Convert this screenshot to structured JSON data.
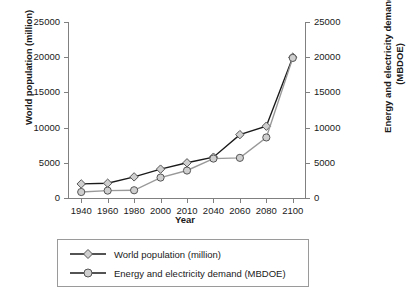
{
  "chart_data": {
    "type": "line",
    "title": "",
    "xlabel": "Year",
    "ylabel": "World population (million)",
    "y2label": "Energy and electricity demand (MBDOE)",
    "categories": [
      "1940",
      "1960",
      "1980",
      "2000",
      "2010",
      "2040",
      "2060",
      "2080",
      "2100"
    ],
    "yticks": [
      0,
      5000,
      10000,
      15000,
      20000,
      25000
    ],
    "y2ticks": [
      0,
      5000,
      10000,
      15000,
      20000,
      25000
    ],
    "ylim": [
      0,
      25000
    ],
    "y2lim": [
      0,
      25000
    ],
    "grid": false,
    "legend_position": "below",
    "series": [
      {
        "name": "World population (million)",
        "marker": "diamond",
        "color": "#1a1a1a",
        "axis": "left",
        "values": [
          2000,
          2100,
          3000,
          4100,
          5000,
          5800,
          9000,
          10200,
          20000
        ]
      },
      {
        "name": "Energy and electricity demand (MBDOE)",
        "marker": "circle",
        "color": "#999999",
        "axis": "right",
        "values": [
          850,
          1050,
          1100,
          2900,
          3900,
          5600,
          5700,
          8600,
          19900
        ]
      }
    ]
  },
  "axis": {
    "ytitle_left": "World population (million)",
    "ytitle_right": "Energy and electricity demand\n(MBDOE)",
    "ytitle_right_line1": "Energy and electricity demand",
    "ytitle_right_line2": "(MBDOE)",
    "xtitle": "Year"
  },
  "legend": {
    "items": [
      {
        "label": "World population (million)",
        "marker": "diamond-marker"
      },
      {
        "label": "Energy and electricity demand (MBDOE)",
        "marker": "circle-marker"
      }
    ]
  },
  "colors": {
    "series1": "#1a1a1a",
    "series2": "#999999",
    "axis": "#808080",
    "marker_fill": "#cfcfcf",
    "background": "#ffffff"
  }
}
